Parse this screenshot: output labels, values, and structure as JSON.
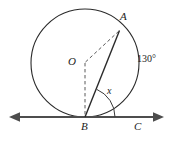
{
  "figure": {
    "type": "circle-tangent-geometry-diagram",
    "width": 174,
    "height": 145,
    "background_color": "#ffffff",
    "stroke_color": "#1c1c1c",
    "line_color": "#4a4a4a"
  },
  "labels": {
    "point_a": "A",
    "center_o": "O",
    "point_b": "B",
    "point_c": "C",
    "unknown_angle": "x",
    "arc_angle": "130°"
  },
  "geometry": {
    "circle": {
      "cx": 85,
      "cy": 63,
      "r": 54
    },
    "center_point": {
      "x": 85,
      "y": 63
    },
    "point_a": {
      "x": 119.5,
      "y": 30.5
    },
    "point_b": {
      "x": 85,
      "y": 117
    },
    "point_c": {
      "x": 140,
      "y": 117
    },
    "tangent_line": {
      "x1": 11,
      "y1": 117,
      "x2": 162,
      "y2": 117
    },
    "chord_ba": {
      "x1": 85,
      "y1": 117,
      "x2": 119.5,
      "y2": 30.5
    },
    "radius_oa_dashed": {
      "x1": 85,
      "y1": 63,
      "x2": 119.5,
      "y2": 30.5
    },
    "radius_ob_dashed": {
      "x1": 85,
      "y1": 63,
      "x2": 85,
      "y2": 117
    },
    "angle_arc_at_b": {
      "cx": 85,
      "cy": 117,
      "r": 30,
      "from_deg": 0,
      "to_deg": 68
    }
  },
  "values": {
    "central_angle_aob_deg": 130,
    "tangent_chord_angle_label": "x"
  }
}
